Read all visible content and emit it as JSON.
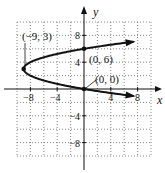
{
  "chart_data": {
    "type": "line",
    "title": "",
    "equation": "x = y^2 - 6y",
    "xlabel": "x",
    "ylabel": "y",
    "xlim": [
      -10,
      10
    ],
    "ylim": [
      -10,
      10
    ],
    "grid": true,
    "grid_step": 2,
    "x_ticks": [
      -8,
      -4,
      4,
      8
    ],
    "y_ticks": [
      8,
      4,
      -4,
      -8
    ],
    "x_tick_labels": [
      "−8",
      "−4",
      "4",
      "8"
    ],
    "y_tick_labels": [
      "8",
      "4",
      "−4",
      "−8"
    ],
    "series": [
      {
        "name": "parabola",
        "points": [
          {
            "x": 7.0,
            "y": 7.0
          },
          {
            "x": 0,
            "y": 6
          },
          {
            "x": -5,
            "y": 5
          },
          {
            "x": -8,
            "y": 4
          },
          {
            "x": -9,
            "y": 3
          },
          {
            "x": -8,
            "y": 2
          },
          {
            "x": -5,
            "y": 1
          },
          {
            "x": 0,
            "y": 0
          },
          {
            "x": 7.0,
            "y": -1.0
          }
        ]
      }
    ],
    "annotations": [
      {
        "label": "(−9, 3)",
        "x": -9,
        "y": 3
      },
      {
        "label": "(0, 6)",
        "x": 0,
        "y": 6
      },
      {
        "label": "(0, 0)",
        "x": 0,
        "y": 0
      }
    ]
  }
}
